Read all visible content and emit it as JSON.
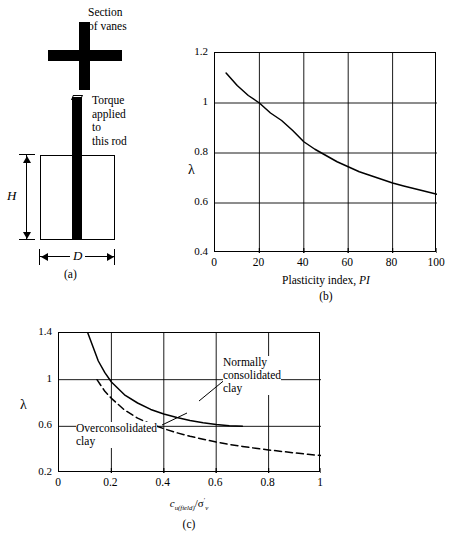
{
  "figure": {
    "panel_a": {
      "caption": "(a)",
      "label_section_of_vanes": "Section\nof vanes",
      "label_torque": "Torque\napplied\nto\nthis rod",
      "label_height": "H",
      "label_diameter": "D"
    },
    "panel_b": {
      "caption": "(b)",
      "ylabel": "λ",
      "xlabel_prefix": "Plasticity index, ",
      "xlabel_symbol": "PI"
    },
    "panel_c": {
      "caption": "(c)",
      "ylabel": "λ",
      "xlabel": "c_u(field)/σ'_v",
      "xlabel_parts": {
        "c": "c",
        "c_sub": "u(field)",
        "slash": "/",
        "sigma": "σ",
        "sigma_sub": "v",
        "prime": "′"
      },
      "curve_label_normally_consolidated": "Normally\nconsolidated\nclay",
      "curve_label_overconsolidated": "Overconsolidated\nclay"
    }
  },
  "chart_data": [
    {
      "type": "line",
      "panel": "(b)",
      "title": "",
      "xlabel": "Plasticity index, PI",
      "ylabel": "λ",
      "xlim": [
        0,
        100
      ],
      "ylim": [
        0.4,
        1.2
      ],
      "xticks": [
        0,
        20,
        40,
        60,
        80,
        100
      ],
      "yticks": [
        0.4,
        0.6,
        0.8,
        1.0,
        1.2
      ],
      "grid": true,
      "legend": "none",
      "series": [
        {
          "name": "correction factor",
          "style": "solid",
          "x": [
            5,
            10,
            15,
            20,
            25,
            30,
            35,
            40,
            45,
            50,
            55,
            60,
            65,
            70,
            75,
            80,
            85,
            90,
            95,
            100
          ],
          "y": [
            1.12,
            1.07,
            1.03,
            1.0,
            0.96,
            0.93,
            0.89,
            0.845,
            0.815,
            0.79,
            0.765,
            0.745,
            0.725,
            0.71,
            0.695,
            0.68,
            0.668,
            0.657,
            0.646,
            0.635
          ]
        }
      ]
    },
    {
      "type": "line",
      "panel": "(c)",
      "title": "",
      "xlabel": "c_u(field)/σ'_v",
      "ylabel": "λ",
      "xlim": [
        0,
        1.0
      ],
      "ylim": [
        0.2,
        1.4
      ],
      "xticks": [
        0,
        0.2,
        0.4,
        0.6,
        0.8,
        1.0
      ],
      "yticks": [
        0.2,
        0.6,
        1.0,
        1.4
      ],
      "grid": true,
      "legend": "inline-annotations",
      "series": [
        {
          "name": "Normally consolidated clay",
          "style": "solid",
          "x": [
            0.11,
            0.13,
            0.15,
            0.175,
            0.2,
            0.25,
            0.3,
            0.35,
            0.4,
            0.45,
            0.5,
            0.55,
            0.6,
            0.65,
            0.7
          ],
          "y": [
            1.4,
            1.28,
            1.16,
            1.06,
            0.98,
            0.87,
            0.8,
            0.745,
            0.705,
            0.675,
            0.65,
            0.63,
            0.615,
            0.605,
            0.6
          ]
        },
        {
          "name": "Overconsolidated clay",
          "style": "dashed",
          "x": [
            0.145,
            0.175,
            0.2,
            0.25,
            0.3,
            0.35,
            0.4,
            0.45,
            0.5,
            0.55,
            0.6,
            0.65,
            0.7,
            0.75,
            0.8,
            0.85,
            0.9,
            0.95,
            1.0
          ],
          "y": [
            1.0,
            0.9,
            0.84,
            0.74,
            0.67,
            0.62,
            0.58,
            0.545,
            0.515,
            0.49,
            0.465,
            0.445,
            0.428,
            0.412,
            0.398,
            0.385,
            0.372,
            0.36,
            0.35
          ]
        }
      ]
    }
  ]
}
